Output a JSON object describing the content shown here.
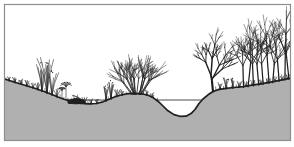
{
  "figure": {
    "style": "black ink on white paper with flat gray soil shading"
  },
  "colors": {
    "paper": "#ffffff",
    "frame": "#8e8e8e",
    "soil": "#b0b0b0",
    "ink": "#1f1f1f"
  },
  "canvas": {
    "width": 294,
    "height": 147,
    "frame": {
      "x": 4.5,
      "y": 4.5,
      "w": 286,
      "h": 136
    }
  },
  "scene": {
    "ground_profile": [
      [
        4.5,
        79
      ],
      [
        14,
        82
      ],
      [
        24,
        85
      ],
      [
        34,
        88
      ],
      [
        44,
        91.5
      ],
      [
        52,
        94.5
      ],
      [
        58,
        97
      ],
      [
        64,
        99.3
      ],
      [
        72,
        101.5
      ],
      [
        80,
        102.8
      ],
      [
        88,
        103.8
      ],
      [
        96,
        103.5
      ],
      [
        103,
        101.8
      ],
      [
        109,
        99.2
      ],
      [
        115,
        96.8
      ],
      [
        121,
        95
      ],
      [
        128,
        93.7
      ],
      [
        135,
        93.3
      ],
      [
        142,
        93.8
      ],
      [
        148,
        95.3
      ],
      [
        153,
        97.6
      ],
      [
        158,
        101.2
      ],
      [
        163,
        106
      ],
      [
        168,
        110.8
      ],
      [
        174,
        114.6
      ],
      [
        180,
        116.3
      ],
      [
        186,
        116.2
      ],
      [
        191,
        113.6
      ],
      [
        195,
        109.5
      ],
      [
        199,
        103.5
      ],
      [
        203,
        99
      ],
      [
        208,
        94.8
      ],
      [
        213,
        91.5
      ],
      [
        219,
        89.4
      ],
      [
        226,
        88.3
      ],
      [
        234,
        87.5
      ],
      [
        243,
        86.6
      ],
      [
        252,
        85.2
      ],
      [
        262,
        83.6
      ],
      [
        272,
        81.8
      ],
      [
        282,
        79.8
      ],
      [
        291,
        78
      ]
    ],
    "water_line": {
      "x1": 58,
      "x2": 206,
      "y": 100
    },
    "vegetation": [
      {
        "kind": "stubble",
        "from": 6,
        "to": 97
      },
      {
        "kind": "stubble",
        "from": 108,
        "to": 158
      },
      {
        "kind": "stubble",
        "from": 216,
        "to": 290
      },
      {
        "kind": "grass",
        "x": 9,
        "h": 4,
        "n": 3
      },
      {
        "kind": "grass",
        "x": 15,
        "h": 5,
        "n": 4
      },
      {
        "kind": "grass",
        "x": 21,
        "h": 5,
        "n": 4
      },
      {
        "kind": "grass",
        "x": 27,
        "h": 6,
        "n": 4
      },
      {
        "kind": "grass",
        "x": 33,
        "h": 5,
        "n": 3
      },
      {
        "kind": "grass",
        "x": 38,
        "h": 7,
        "n": 4
      },
      {
        "kind": "tallgrass",
        "x": 42,
        "h": 28,
        "n": 7
      },
      {
        "kind": "tallgrass",
        "x": 47,
        "h": 34,
        "n": 8
      },
      {
        "kind": "tallgrass",
        "x": 52,
        "h": 23,
        "n": 6
      },
      {
        "kind": "grass",
        "x": 57,
        "h": 8,
        "n": 4
      },
      {
        "kind": "umbel",
        "x": 62,
        "h": 9
      },
      {
        "kind": "umbel",
        "x": 66,
        "h": 14
      },
      {
        "kind": "clump",
        "x": 76
      },
      {
        "kind": "grass",
        "x": 85,
        "h": 6,
        "n": 4
      },
      {
        "kind": "grass",
        "x": 91,
        "h": 5,
        "n": 3
      },
      {
        "kind": "grass",
        "x": 97,
        "h": 4,
        "n": 3
      },
      {
        "kind": "tallgrass",
        "x": 106,
        "h": 14,
        "n": 6
      },
      {
        "kind": "tallgrass",
        "x": 111,
        "h": 18,
        "n": 7
      },
      {
        "kind": "grass",
        "x": 117,
        "h": 7,
        "n": 4
      },
      {
        "kind": "grass",
        "x": 122,
        "h": 5,
        "n": 3
      },
      {
        "kind": "shrub",
        "x": 137,
        "h": 40,
        "stems": 16
      },
      {
        "kind": "grass",
        "x": 147,
        "h": 5,
        "n": 3
      },
      {
        "kind": "grass",
        "x": 152,
        "h": 5,
        "n": 3
      },
      {
        "kind": "grass",
        "x": 220,
        "h": 7,
        "n": 4
      },
      {
        "kind": "tallgrass",
        "x": 226,
        "h": 11,
        "n": 5
      },
      {
        "kind": "tallgrass",
        "x": 233,
        "h": 9,
        "n": 5
      },
      {
        "kind": "grass",
        "x": 239,
        "h": 6,
        "n": 4
      },
      {
        "kind": "tree",
        "x": 213,
        "h": 64
      },
      {
        "kind": "grass",
        "x": 246,
        "h": 6,
        "n": 3
      },
      {
        "kind": "grass",
        "x": 253,
        "h": 6,
        "n": 3
      },
      {
        "kind": "thicket",
        "from": 244,
        "to": 289,
        "trunks": 10,
        "h": 62
      },
      {
        "kind": "grass",
        "x": 261,
        "h": 5,
        "n": 3
      },
      {
        "kind": "grass",
        "x": 268,
        "h": 5,
        "n": 3
      },
      {
        "kind": "grass",
        "x": 275,
        "h": 5,
        "n": 3
      },
      {
        "kind": "grass",
        "x": 282,
        "h": 5,
        "n": 3
      },
      {
        "kind": "grass",
        "x": 288,
        "h": 5,
        "n": 3
      }
    ]
  }
}
